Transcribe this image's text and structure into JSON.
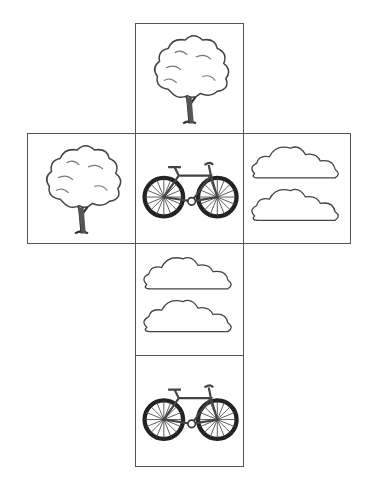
{
  "diagram": {
    "type": "cube-net",
    "line_color": "#555555",
    "faces": [
      {
        "id": "top",
        "picture": "tree",
        "x": 135,
        "y": 23,
        "w": 108,
        "h": 110
      },
      {
        "id": "left",
        "picture": "tree",
        "x": 27,
        "y": 133,
        "w": 108,
        "h": 110
      },
      {
        "id": "center",
        "picture": "bicycle",
        "x": 135,
        "y": 133,
        "w": 108,
        "h": 110
      },
      {
        "id": "right",
        "picture": "clouds",
        "x": 243,
        "y": 133,
        "w": 107,
        "h": 110
      },
      {
        "id": "below-center",
        "picture": "clouds",
        "x": 135,
        "y": 243,
        "w": 108,
        "h": 112
      },
      {
        "id": "bottom",
        "picture": "bicycle",
        "x": 135,
        "y": 355,
        "w": 108,
        "h": 111
      }
    ]
  }
}
